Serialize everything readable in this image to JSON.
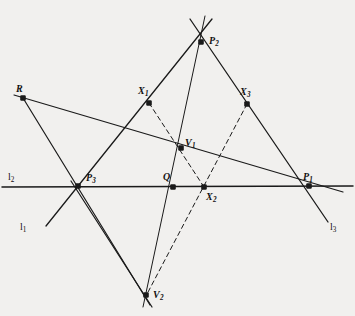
{
  "figure": {
    "background_color": "#f1f0ee",
    "stroke_color": "#1a1a1a",
    "dash_color": "#1a1a1a",
    "width": 355,
    "height": 316
  },
  "points": [
    {
      "id": "R",
      "label": "R",
      "sub": "",
      "x": 23,
      "y": 98,
      "label_x": 16,
      "label_y": 84
    },
    {
      "id": "P2",
      "label": "P",
      "sub": "2",
      "x": 201,
      "y": 42,
      "label_x": 209,
      "label_y": 36
    },
    {
      "id": "X1",
      "label": "X",
      "sub": "1",
      "x": 149,
      "y": 103,
      "label_x": 138,
      "label_y": 86
    },
    {
      "id": "X3",
      "label": "X",
      "sub": "3",
      "x": 247,
      "y": 104,
      "label_x": 240,
      "label_y": 87
    },
    {
      "id": "V1",
      "label": "V",
      "sub": "1",
      "x": 181,
      "y": 148,
      "label_x": 185,
      "label_y": 138
    },
    {
      "id": "P3",
      "label": "P",
      "sub": "3",
      "x": 78,
      "y": 186,
      "label_x": 86,
      "label_y": 173
    },
    {
      "id": "Q",
      "label": "Q",
      "sub": "",
      "x": 173,
      "y": 187,
      "label_x": 163,
      "label_y": 172
    },
    {
      "id": "X2",
      "label": "X",
      "sub": "2",
      "x": 204,
      "y": 187,
      "label_x": 206,
      "label_y": 192
    },
    {
      "id": "P1",
      "label": "P",
      "sub": "1",
      "x": 309,
      "y": 186,
      "label_x": 303,
      "label_y": 172
    },
    {
      "id": "V2",
      "label": "V",
      "sub": "2",
      "x": 146,
      "y": 295,
      "label_x": 153,
      "label_y": 290
    }
  ],
  "line_labels": [
    {
      "id": "l1",
      "label": "l",
      "sub": "1",
      "x": 20,
      "y": 222
    },
    {
      "id": "l2",
      "label": "l",
      "sub": "2",
      "x": 8,
      "y": 172
    },
    {
      "id": "l3",
      "label": "l",
      "sub": "3",
      "x": 330,
      "y": 222
    }
  ],
  "segments": [
    {
      "name": "line-l2-horizontal",
      "x1": 2,
      "y1": 187,
      "x2": 353,
      "y2": 186,
      "dashed": false,
      "width": 1.5
    },
    {
      "name": "line-l1-through-P3-P2",
      "x1": 46,
      "y1": 226,
      "x2": 212,
      "y2": 19,
      "dashed": false,
      "width": 1.3
    },
    {
      "name": "line-l3-through-P1-P2",
      "x1": 328,
      "y1": 222,
      "x2": 190,
      "y2": 19,
      "dashed": false,
      "width": 1.3
    },
    {
      "name": "line-R-to-P1",
      "x1": 14,
      "y1": 95,
      "x2": 343,
      "y2": 192,
      "dashed": false,
      "width": 1.2
    },
    {
      "name": "line-R-to-V2",
      "x1": 23,
      "y1": 98,
      "x2": 150,
      "y2": 305,
      "dashed": false,
      "width": 1.2
    },
    {
      "name": "line-P3-to-V2",
      "x1": 71,
      "y1": 181,
      "x2": 152,
      "y2": 307,
      "dashed": false,
      "width": 1.2
    },
    {
      "name": "line-P2-through-Q-to-V2",
      "x1": 205,
      "y1": 16,
      "x2": 143,
      "y2": 307,
      "dashed": false,
      "width": 1.0
    },
    {
      "name": "dashed-X1-to-X2",
      "x1": 149,
      "y1": 103,
      "x2": 204,
      "y2": 187,
      "dashed": true,
      "width": 1.0
    },
    {
      "name": "dashed-X3-to-V2",
      "x1": 247,
      "y1": 104,
      "x2": 147,
      "y2": 294,
      "dashed": true,
      "width": 1.0
    }
  ]
}
